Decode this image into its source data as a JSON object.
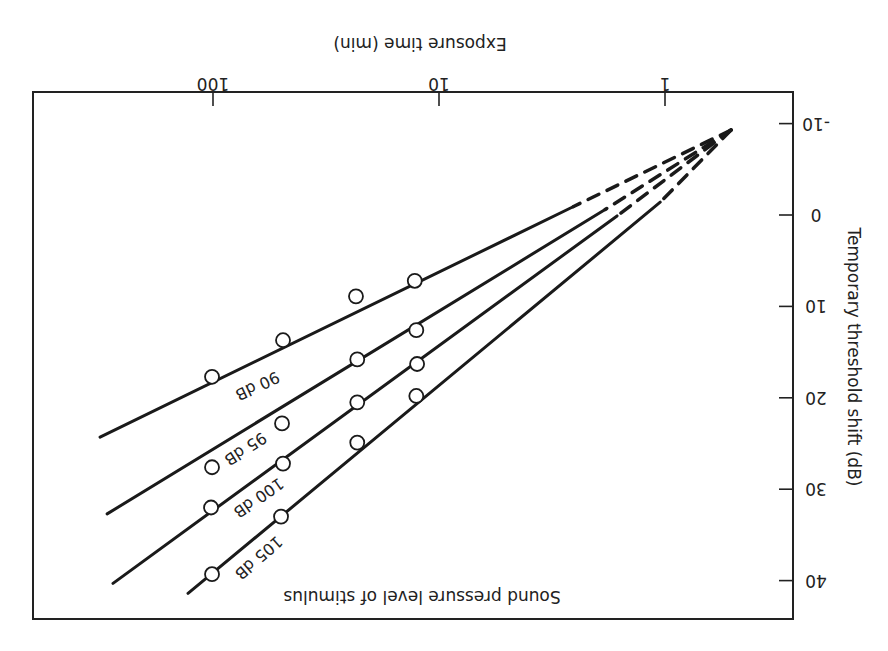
{
  "chart_data": {
    "type": "line",
    "orientation_note": "figure printed rotated 180 degrees",
    "title": "",
    "xlabel": "Exposure time (min)",
    "ylabel": "Temporary threshold shift (dB)",
    "annotation": "Sound pressure level of stimulus",
    "x_scale": "log",
    "xlim": [
      0.3,
      1000
    ],
    "ylim": [
      -12,
      44
    ],
    "x_ticks": [
      {
        "value": 1,
        "label": "1"
      },
      {
        "value": 10,
        "label": "10"
      },
      {
        "value": 100,
        "label": "100"
      }
    ],
    "y_ticks": [
      {
        "value": -10,
        "label": "-10"
      },
      {
        "value": 0,
        "label": "0"
      },
      {
        "value": 10,
        "label": "10"
      },
      {
        "value": 20,
        "label": "20"
      },
      {
        "value": 30,
        "label": "30"
      },
      {
        "value": 40,
        "label": "40"
      }
    ],
    "grid": false,
    "convergence_point": {
      "x": 0.51,
      "y": -9.3
    },
    "series": [
      {
        "name": "90 dB",
        "label": "90 dB",
        "fit_line": {
          "start": {
            "x": 0.51,
            "y": -9.3
          },
          "dash_end": {
            "x": 2.55,
            "y": -0.9
          },
          "end": {
            "x": 316,
            "y": 24.3
          }
        },
        "points": [
          {
            "x": 12.8,
            "y": 7.2
          },
          {
            "x": 23.3,
            "y": 8.9
          },
          {
            "x": 49,
            "y": 13.7
          },
          {
            "x": 101,
            "y": 17.7
          }
        ]
      },
      {
        "name": "95 dB",
        "label": "95 dB",
        "fit_line": {
          "start": {
            "x": 0.51,
            "y": -9.3
          },
          "dash_end": {
            "x": 1.84,
            "y": -0.6
          },
          "end": {
            "x": 294,
            "y": 32.7
          }
        },
        "points": [
          {
            "x": 12.6,
            "y": 12.6
          },
          {
            "x": 23,
            "y": 15.8
          },
          {
            "x": 49.5,
            "y": 22.8
          },
          {
            "x": 101,
            "y": 27.6
          }
        ]
      },
      {
        "name": "100 dB",
        "label": "100 dB",
        "fit_line": {
          "start": {
            "x": 0.51,
            "y": -9.3
          },
          "dash_end": {
            "x": 1.63,
            "y": 0.1
          },
          "end": {
            "x": 277,
            "y": 40.3
          }
        },
        "points": [
          {
            "x": 12.5,
            "y": 16.3
          },
          {
            "x": 23,
            "y": 20.5
          },
          {
            "x": 49,
            "y": 27.2
          },
          {
            "x": 102,
            "y": 32.0
          }
        ]
      },
      {
        "name": "105 dB",
        "label": "105 dB",
        "fit_line": {
          "start": {
            "x": 0.51,
            "y": -9.3
          },
          "dash_end": {
            "x": 1.05,
            "y": -1.4
          },
          "end": {
            "x": 129,
            "y": 41.4
          }
        },
        "points": [
          {
            "x": 12.6,
            "y": 19.8
          },
          {
            "x": 23,
            "y": 24.9
          },
          {
            "x": 50,
            "y": 33.0
          },
          {
            "x": 101,
            "y": 39.3
          }
        ]
      }
    ]
  }
}
